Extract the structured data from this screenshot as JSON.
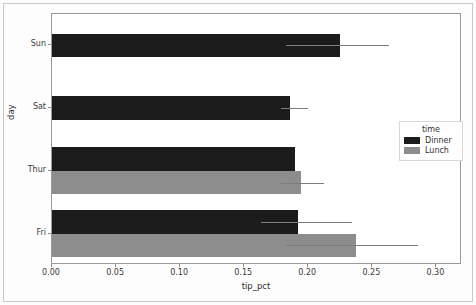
{
  "chart_data": {
    "type": "bar",
    "orientation": "horizontal",
    "title": "",
    "xlabel": "tip_pct",
    "ylabel": "day",
    "categories": [
      "Sun",
      "Sat",
      "Thur",
      "Fri"
    ],
    "xlim": [
      0.0,
      0.32
    ],
    "xticks": [
      0.0,
      0.05,
      0.1,
      0.15,
      0.2,
      0.25,
      0.3
    ],
    "xticklabels": [
      "0.00",
      "0.05",
      "0.10",
      "0.15",
      "0.20",
      "0.25",
      "0.30"
    ],
    "grid": false,
    "legend": {
      "title": "time",
      "position": "center-right",
      "entries": [
        {
          "label": "Dinner",
          "color": "#1b1b1b"
        },
        {
          "label": "Lunch",
          "color": "#8d8d8d"
        }
      ]
    },
    "series": [
      {
        "name": "Dinner",
        "color": "#1b1b1b",
        "values": [
          0.225,
          0.186,
          0.19,
          0.192
        ],
        "err_low": [
          0.183,
          0.179,
          0.19,
          0.163
        ],
        "err_high": [
          0.263,
          0.2,
          0.19,
          0.234
        ]
      },
      {
        "name": "Lunch",
        "color": "#8d8d8d",
        "values": [
          null,
          null,
          0.194,
          0.237
        ],
        "err_low": [
          null,
          null,
          0.179,
          0.183
        ],
        "err_high": [
          null,
          null,
          0.212,
          0.286
        ]
      }
    ]
  },
  "axes": {
    "x_label": "tip_pct",
    "y_label": "day",
    "x_ticks": [
      "0.00",
      "0.05",
      "0.10",
      "0.15",
      "0.20",
      "0.25",
      "0.30"
    ],
    "y_ticks": [
      "Sun",
      "Sat",
      "Thur",
      "Fri"
    ]
  },
  "legend": {
    "title": "time",
    "dinner_label": "Dinner",
    "lunch_label": "Lunch",
    "dinner_color": "#1b1b1b",
    "lunch_color": "#8d8d8d"
  }
}
